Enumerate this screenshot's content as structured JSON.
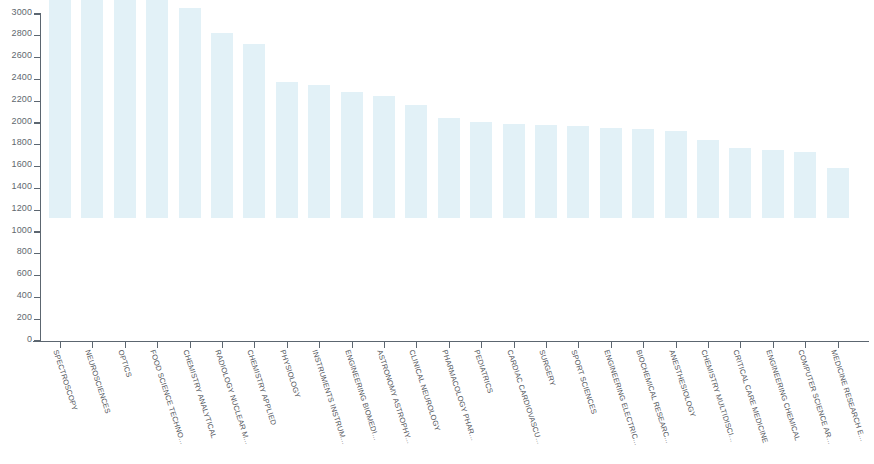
{
  "chart_data": {
    "type": "bar",
    "title": "",
    "subtitle": "",
    "xlabel": "",
    "ylabel": "",
    "ylim": [
      0,
      3000
    ],
    "y_ticks": [
      0,
      200,
      400,
      600,
      800,
      1000,
      1200,
      1400,
      1600,
      1800,
      2000,
      2200,
      2400,
      2600,
      2800,
      3000
    ],
    "grid": false,
    "legend": false,
    "legend_position": "none",
    "bar_color": "#e2f1f7",
    "axis_color": "#5c6670",
    "background_color": "#ffffff",
    "categories": [
      "SPECTROSCOPY",
      "NEUROSCIENCES",
      "OPTICS",
      "FOOD SCIENCE TECHNO...",
      "CHEMISTRY ANALYTICAL",
      "RADIOLOGY NUCLEAR M...",
      "CHEMISTRY APPLIED",
      "PHYSIOLOGY",
      "INSTRUMENTS INSTRUM...",
      "ENGINEERING BIOMEDI...",
      "ASTRONOMY ASTROPHY...",
      "CLINICAL NEUROLOGY",
      "PHARMACOLOGY PHAR...",
      "PEDIATRICS",
      "CARDIAC CARDIOVASCU...",
      "SURGERY",
      "SPORT SCIENCES",
      "ENGINEERING ELECTRIC...",
      "BIOCHEMICAL RESEARC...",
      "ANESTHESIOLOGY",
      "CHEMISTRY MULTIDISCI...",
      "CRITICAL CARE MEDICINE",
      "ENGINEERING CHEMICAL",
      "COMPUTER SCIENCE AR...",
      "MEDICINE RESEARCH E..."
    ],
    "values": [
      3000,
      2170,
      2060,
      2040,
      1930,
      1700,
      1600,
      1250,
      1220,
      1160,
      1120,
      1040,
      920,
      880,
      860,
      850,
      840,
      830,
      820,
      800,
      720,
      640,
      620,
      610,
      460
    ]
  }
}
